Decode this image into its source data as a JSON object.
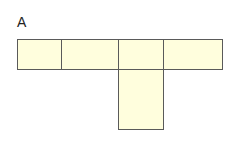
{
  "diagram": {
    "label": "A",
    "type": "net-of-squares",
    "fill_color": "#fffedd",
    "stroke_color": "#5a5a5a",
    "cells": [
      {
        "name": "top-row-cell-1",
        "x": 17,
        "y": 39,
        "w": 45,
        "h": 31
      },
      {
        "name": "top-row-cell-2",
        "x": 61,
        "y": 39,
        "w": 58,
        "h": 31
      },
      {
        "name": "top-row-cell-3",
        "x": 118,
        "y": 39,
        "w": 46,
        "h": 31
      },
      {
        "name": "top-row-cell-4",
        "x": 163,
        "y": 39,
        "w": 60,
        "h": 31
      },
      {
        "name": "stem-cell",
        "x": 118,
        "y": 69,
        "w": 46,
        "h": 61
      }
    ]
  }
}
